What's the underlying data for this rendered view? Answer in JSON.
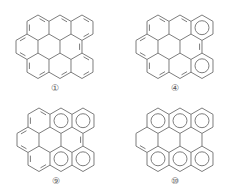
{
  "figure": {
    "line_color": "#6e6e6e",
    "background": "#ffffff",
    "hex_edge_px": 12.7,
    "panels": [
      {
        "id": "1",
        "label": "①",
        "offset": [
          0,
          0
        ],
        "rows": [
          3,
          3,
          3
        ],
        "aromatic_circles": [],
        "description": "benzenoid with Kekulé double bonds in all rings"
      },
      {
        "id": "4",
        "label": "④",
        "offset": [
          120,
          0
        ],
        "rows": [
          3,
          3,
          3
        ],
        "aromatic_circles": [
          "r0c2",
          "r2c2"
        ],
        "description": "Clar sextets in top-right and bottom-right rings"
      },
      {
        "id": "9",
        "label": "⑨",
        "offset": [
          1,
          93
        ],
        "rows": [
          3,
          3,
          3
        ],
        "aromatic_circles": [
          "r0c1",
          "r0c2",
          "r2c1",
          "r2c2"
        ],
        "description": "Clar sextets in top-middle, top-right, bottom-middle, bottom-right rings"
      },
      {
        "id": "10",
        "label": "⑩",
        "offset": [
          120,
          93
        ],
        "rows": [
          3,
          3,
          3
        ],
        "aromatic_circles": [
          "r0c0",
          "r0c1",
          "r0c2",
          "r2c0",
          "r2c1",
          "r2c2"
        ],
        "description": "Clar sextets in all top and bottom rings, one isolated double bond on left"
      }
    ]
  }
}
